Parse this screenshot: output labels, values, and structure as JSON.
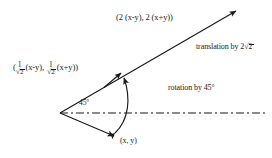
{
  "figure": {
    "type": "geometry-diagram",
    "title": "",
    "background_color": "#ffffff",
    "stroke_color": "#1a1a1a",
    "labels": {
      "translated_point": "(2 (x-y), 2 (x+y))",
      "translation_note": "translation by 2",
      "translation_radicand": "2",
      "rotation_note": "rotation by 45°",
      "angle": "45°",
      "origin_point": "(x, y)",
      "rotated_point": {
        "open_paren": "(",
        "frac1_num": "1",
        "frac1_den_radicand": "2",
        "term1": "(x-y),",
        "frac2_num": "1",
        "frac2_den_radicand": "2",
        "term2": "(x+y))"
      }
    },
    "geometry": {
      "vertex": [
        60,
        113
      ],
      "ray_tip": [
        238,
        10
      ],
      "rotated_point_tip": [
        122,
        72
      ],
      "origin_point_tip": [
        116,
        137
      ],
      "dash_line_end": [
        266,
        113
      ],
      "ray_angle_deg": 30,
      "rotation_angle_deg": 45,
      "translation_factor": "2√2"
    }
  }
}
